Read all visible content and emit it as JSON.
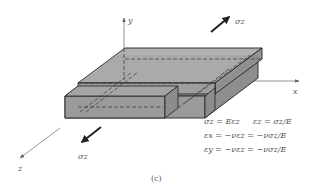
{
  "figure": {
    "caption": "(c)",
    "axes": {
      "x_label": "x",
      "y_label": "y",
      "z_label": "z"
    },
    "stress_labels": {
      "top_right": "σz",
      "bottom_left": "σz"
    },
    "equations": [
      {
        "left": "σz = Eεz",
        "right": "εz = σz/E"
      },
      {
        "left": "εx = −νεz = −νσz/E"
      },
      {
        "left": "εy = −νεz = −νσz/E"
      }
    ],
    "colors": {
      "face_top": "#a9a9a9",
      "face_front": "#9c9c9c",
      "face_side": "#8f8f8f",
      "edge": "#222222",
      "text": "#555555"
    }
  }
}
